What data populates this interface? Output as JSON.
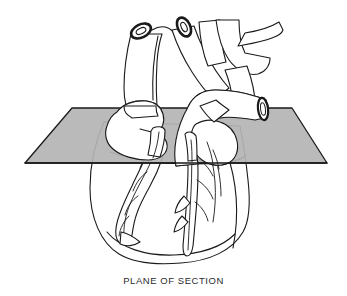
{
  "figure": {
    "caption": "PLANE OF SECTION",
    "background_color": "#ffffff",
    "line_color": "#1a1a1a",
    "fill_color": "#ffffff",
    "plane": {
      "label": "section-plane",
      "fill_color": "#b4b4b4",
      "edge_color": "#1a1a1a",
      "shape": "parallelogram",
      "vertices": "72,108 292,108 327,163 25,163"
    },
    "structures": [
      {
        "name": "superior-vena-cava",
        "cut_end": true
      },
      {
        "name": "brachiocephalic-artery",
        "cut_end": true
      },
      {
        "name": "aortic-arch",
        "cut_end": false
      },
      {
        "name": "left-common-carotid-artery",
        "cut_end": false
      },
      {
        "name": "left-subclavian-artery",
        "cut_end": false
      },
      {
        "name": "pulmonary-trunk",
        "cut_end": true
      },
      {
        "name": "right-atrial-appendage",
        "cut_end": false
      },
      {
        "name": "left-atrial-appendage",
        "cut_end": false
      },
      {
        "name": "right-ventricle",
        "cut_end": false
      },
      {
        "name": "left-ventricle",
        "cut_end": false
      },
      {
        "name": "right-coronary-artery",
        "cut_end": false
      },
      {
        "name": "left-anterior-descending-artery",
        "cut_end": false
      },
      {
        "name": "cardiac-apex",
        "cut_end": false
      }
    ]
  }
}
